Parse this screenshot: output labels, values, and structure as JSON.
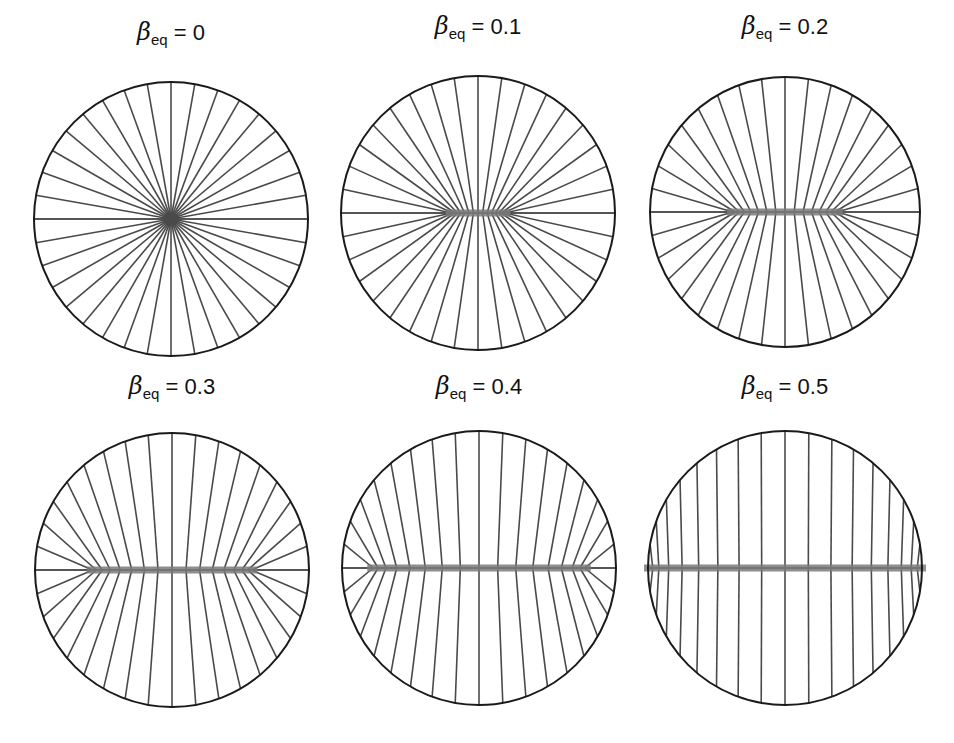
{
  "figure": {
    "symbol": "β",
    "subscript": "eq",
    "equals": "=",
    "line_count": 36,
    "colors": {
      "circle": "#1a1a1a",
      "field_line": "#4a4a4a",
      "band": "#7a7a7a"
    },
    "panels": [
      {
        "value": "0",
        "beta": 0.0,
        "cx": 171,
        "cy": 219,
        "r": 137,
        "title_y": 8
      },
      {
        "value": "0.1",
        "beta": 0.1,
        "cx": 478,
        "cy": 213,
        "r": 137,
        "title_y": 2
      },
      {
        "value": "0.2",
        "beta": 0.2,
        "cx": 785,
        "cy": 212,
        "r": 135,
        "title_y": 2
      },
      {
        "value": "0.3",
        "beta": 0.3,
        "cx": 172,
        "cy": 570,
        "r": 137,
        "title_y": 362
      },
      {
        "value": "0.4",
        "beta": 0.4,
        "cx": 479,
        "cy": 568,
        "r": 137,
        "title_y": 362
      },
      {
        "value": "0.5",
        "beta": 0.5,
        "cx": 785,
        "cy": 568,
        "r": 137,
        "title_y": 362
      }
    ]
  }
}
